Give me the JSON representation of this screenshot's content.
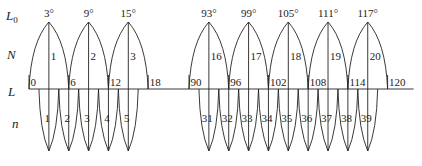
{
  "row_labels": {
    "central_meridian": "L",
    "central_meridian_sub": "0",
    "zone_6": "N",
    "longitude": "L",
    "zone_3": "n"
  },
  "scale": {
    "origin_x": 29,
    "px_per_degree": 6.62,
    "break_after": 18,
    "resume_at": 90,
    "resume_x": 189,
    "axis_y": 89
  },
  "longitude_ticks": [
    {
      "value": 0,
      "label": "0"
    },
    {
      "value": 6,
      "label": "6"
    },
    {
      "value": 12,
      "label": "12"
    },
    {
      "value": 18,
      "label": "18"
    },
    {
      "value": 90,
      "label": "90"
    },
    {
      "value": 96,
      "label": "96"
    },
    {
      "value": 102,
      "label": "102"
    },
    {
      "value": 108,
      "label": "108"
    },
    {
      "value": 114,
      "label": "114"
    },
    {
      "value": 120,
      "label": "120"
    }
  ],
  "zones_6deg": [
    {
      "number": "1",
      "central_meridian": 3,
      "label": "3°",
      "from": 0,
      "to": 6
    },
    {
      "number": "2",
      "central_meridian": 9,
      "label": "9°",
      "from": 6,
      "to": 12
    },
    {
      "number": "3",
      "central_meridian": 15,
      "label": "15°",
      "from": 12,
      "to": 18
    },
    {
      "number": "16",
      "central_meridian": 93,
      "label": "93°",
      "from": 90,
      "to": 96
    },
    {
      "number": "17",
      "central_meridian": 99,
      "label": "99°",
      "from": 96,
      "to": 102
    },
    {
      "number": "18",
      "central_meridian": 105,
      "label": "105°",
      "from": 102,
      "to": 108
    },
    {
      "number": "19",
      "central_meridian": 111,
      "label": "111°",
      "from": 108,
      "to": 114
    },
    {
      "number": "20",
      "central_meridian": 117,
      "label": "117°",
      "from": 114,
      "to": 120
    }
  ],
  "zones_3deg": [
    {
      "number": "1",
      "central_meridian": 3
    },
    {
      "number": "2",
      "central_meridian": 6
    },
    {
      "number": "3",
      "central_meridian": 9
    },
    {
      "number": "4",
      "central_meridian": 12
    },
    {
      "number": "5",
      "central_meridian": 15
    },
    {
      "number": "31",
      "central_meridian": 93
    },
    {
      "number": "32",
      "central_meridian": 96
    },
    {
      "number": "33",
      "central_meridian": 99
    },
    {
      "number": "34",
      "central_meridian": 102
    },
    {
      "number": "35",
      "central_meridian": 105
    },
    {
      "number": "36",
      "central_meridian": 108
    },
    {
      "number": "37",
      "central_meridian": 111
    },
    {
      "number": "38",
      "central_meridian": 114
    },
    {
      "number": "39",
      "central_meridian": 117
    }
  ]
}
